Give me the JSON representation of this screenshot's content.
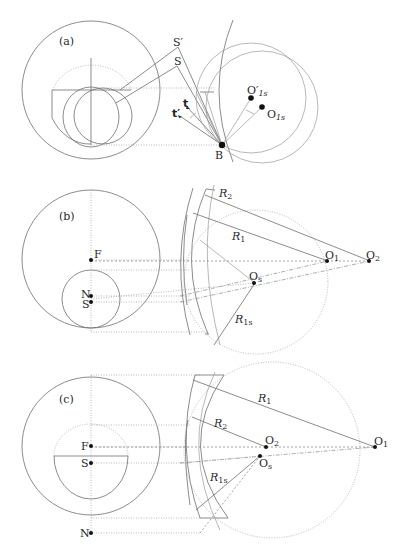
{
  "panels": [
    {
      "id": "a",
      "label": "(a)",
      "points": {
        "S_prime": "S′",
        "S": "S",
        "t": "t",
        "t_prime": "t′",
        "B": "B",
        "O1s_prime": "O′",
        "O1s_prime_sub": "1s",
        "O1s": "O",
        "O1s_sub": "1s"
      }
    },
    {
      "id": "b",
      "label": "(b)",
      "points": {
        "F": "F",
        "N": "N",
        "S": "S",
        "O1": "O",
        "O1_sub": "1",
        "O2": "O",
        "O2_sub": "2",
        "Os": "O",
        "Os_sub": "s"
      },
      "radii": {
        "R2": "R",
        "R2_sub": "2",
        "R1": "R",
        "R1_sub": "1",
        "R1s": "R",
        "R1s_sub": "1s"
      }
    },
    {
      "id": "c",
      "label": "(c)",
      "points": {
        "F": "F",
        "S": "S",
        "N": "N",
        "O1": "O",
        "O1_sub": "1",
        "O2": "O",
        "O2_sub": "2",
        "Os": "O",
        "Os_sub": "s"
      },
      "radii": {
        "R1": "R",
        "R1_sub": "1",
        "R2": "R",
        "R2_sub": "2",
        "R1s": "R",
        "R1s_sub": "1s"
      }
    }
  ],
  "colors": {
    "line": "#6e6e6e",
    "light": "#a8a8a8",
    "point": "#111111"
  }
}
